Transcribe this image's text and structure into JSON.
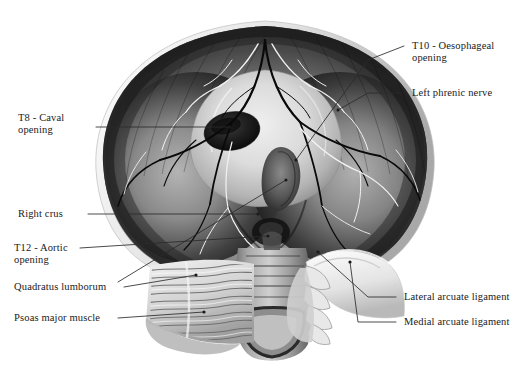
{
  "figure": {
    "background_color": "#ffffff",
    "ink_color": "#1a1a1a",
    "leader_color": "#2b2b2b"
  },
  "labels": {
    "t8_caval": "T8 - Caval\nopening",
    "right_crus": "Right crus",
    "t12_aortic": "T12 - Aortic\nopening",
    "quadratus": "Quadratus lumborum",
    "psoas": "Psoas major muscle",
    "t10_oesophageal": "T10 - Oesophageal\nopening",
    "left_phrenic": "Left phrenic nerve",
    "lateral_arcuate": "Lateral arcuate ligament",
    "medial_arcuate": "Medial arcuate ligament"
  },
  "structures": {
    "diaphragm_dome": "diaphragm-dome",
    "central_tendon": "central-tendon",
    "caval_foramen": "caval-foramen",
    "oesophageal_hiatus": "oesophageal-hiatus",
    "aortic_hiatus": "aortic-hiatus",
    "vertebral_column": "vertebral-column",
    "rib_cage_margin": "rib-cage-margin",
    "psoas_muscle": "psoas-major-muscle",
    "quadratus_muscle": "quadratus-lumborum-muscle",
    "phrenic_nerve_branches": "phrenic-nerve-branches",
    "vascular_branches": "vascular-branches",
    "arcuate_ligaments": "arcuate-ligaments"
  }
}
